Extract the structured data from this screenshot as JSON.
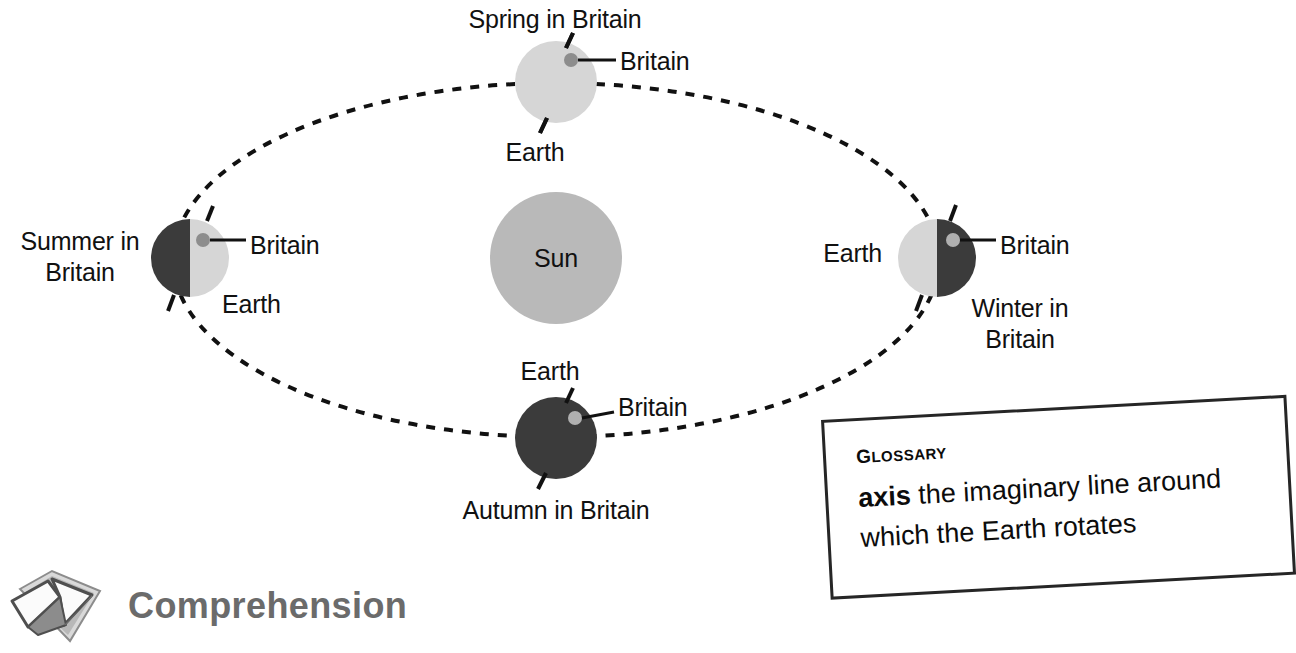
{
  "page": {
    "width": 1296,
    "height": 653,
    "background": "#ffffff"
  },
  "colors": {
    "sun_fill": "#b9b9b9",
    "earth_light": "#d6d6d6",
    "earth_dark": "#3b3b3b",
    "britain_dot_on_light": "#8d8d8d",
    "britain_dot_on_dark": "#b0b0b0",
    "orbit_line": "#111111",
    "leader_line": "#111111",
    "text": "#111111",
    "glossary_border": "#262626",
    "glossary_shadow": "#e8e9ef",
    "comprehension_text": "#6b6b6b",
    "book_outline": "#5a5a5a",
    "book_page": "#fbfbfb"
  },
  "diagram": {
    "type": "orbit-seasons",
    "orbit": {
      "label": "orbit path",
      "style": "dashed ellipse",
      "center_x": 556,
      "center_y": 260,
      "radius_x": 383,
      "radius_y": 177,
      "dash": "9 9",
      "stroke_width": 4
    },
    "sun": {
      "label": "Sun",
      "center_x": 556,
      "center_y": 258,
      "radius": 66
    },
    "positions": [
      {
        "key": "spring",
        "season_label": "Spring in Britain",
        "earth_label": "Earth",
        "britain_label": "Britain",
        "center_x": 556,
        "center_y": 82,
        "radius": 41,
        "lit_side": "full-light",
        "britain_on": "light",
        "britain_dot_x": 571,
        "britain_dot_y": 60
      },
      {
        "key": "summer",
        "season_label": "Summer in Britain",
        "earth_label": "Earth",
        "britain_label": "Britain",
        "center_x": 190,
        "center_y": 258,
        "radius": 39,
        "lit_side": "right",
        "britain_on": "light",
        "britain_dot_x": 203,
        "britain_dot_y": 240
      },
      {
        "key": "autumn",
        "season_label": "Autumn in Britain",
        "earth_label": "Earth",
        "britain_label": "Britain",
        "center_x": 556,
        "center_y": 438,
        "radius": 41,
        "lit_side": "full-dark",
        "britain_on": "dark",
        "britain_dot_x": 575,
        "britain_dot_y": 418
      },
      {
        "key": "winter",
        "season_label": "Winter in Britain",
        "earth_label": "Earth",
        "britain_label": "Britain",
        "center_x": 937,
        "center_y": 258,
        "radius": 39,
        "lit_side": "left",
        "britain_on": "dark",
        "britain_dot_x": 953,
        "britain_dot_y": 240
      }
    ]
  },
  "labels": {
    "spring_season": "Spring in Britain",
    "spring_britain": "Britain",
    "spring_earth": "Earth",
    "summer_season_line1": "Summer in",
    "summer_season_line2": "Britain",
    "summer_britain": "Britain",
    "summer_earth": "Earth",
    "sun": "Sun",
    "winter_earth": "Earth",
    "winter_britain": "Britain",
    "winter_season_line1": "Winter in",
    "winter_season_line2": "Britain",
    "autumn_earth": "Earth",
    "autumn_britain": "Britain",
    "autumn_season": "Autumn in Britain"
  },
  "glossary": {
    "heading": "Glossary",
    "term": "axis",
    "definition": "the imaginary line around which the Earth rotates"
  },
  "footer": {
    "icon": "open-book-icon",
    "label": "Comprehension"
  }
}
